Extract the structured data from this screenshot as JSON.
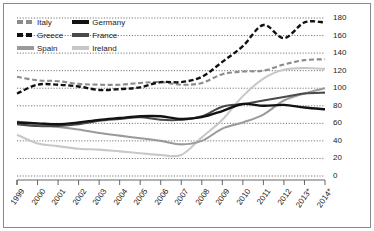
{
  "chart_data": {
    "type": "line",
    "title": "",
    "subtitle": "",
    "xlabel": "",
    "ylabel": "",
    "grid": true,
    "legend_position": "top-left",
    "x": [
      "1999",
      "2000",
      "2001",
      "2002",
      "2003",
      "2004",
      "2005",
      "2006",
      "2007",
      "2008",
      "2009",
      "2010",
      "2011",
      "2012",
      "2013*",
      "2014*"
    ],
    "xlim": [
      0,
      15
    ],
    "ylim": [
      0,
      180
    ],
    "yticks": [
      0,
      20,
      40,
      60,
      80,
      100,
      120,
      140,
      160,
      180
    ],
    "series": [
      {
        "name": "Italy",
        "style": "dashed",
        "color": "#8c8c8c",
        "values": [
          113,
          109,
          108,
          105,
          104,
          104,
          106,
          107,
          104,
          106,
          116,
          119,
          120,
          127,
          132,
          133
        ]
      },
      {
        "name": "Greece",
        "style": "dashed",
        "color": "#111111",
        "values": [
          94,
          104,
          104,
          102,
          98,
          99,
          101,
          107,
          107,
          113,
          130,
          148,
          172,
          157,
          175,
          175
        ]
      },
      {
        "name": "Spain",
        "style": "solid",
        "color": "#9a9a9a",
        "values": [
          62,
          59,
          56,
          53,
          49,
          46,
          43,
          40,
          36,
          40,
          54,
          61,
          70,
          86,
          94,
          100
        ]
      },
      {
        "name": "Germany",
        "style": "solid",
        "color": "#121212",
        "values": [
          61,
          60,
          59,
          61,
          64,
          66,
          68,
          68,
          65,
          67,
          74,
          82,
          80,
          81,
          78,
          76
        ]
      },
      {
        "name": "France",
        "style": "solid",
        "color": "#4a4a4a",
        "values": [
          59,
          57,
          57,
          59,
          63,
          65,
          67,
          64,
          64,
          68,
          79,
          82,
          86,
          90,
          94,
          95
        ]
      },
      {
        "name": "Ireland",
        "style": "solid",
        "color": "#c8c8c8",
        "values": [
          47,
          37,
          34,
          31,
          30,
          28,
          26,
          24,
          24,
          44,
          64,
          91,
          111,
          121,
          123,
          122
        ]
      }
    ]
  },
  "legend": {
    "columns": [
      {
        "items": [
          {
            "label": "Italy",
            "key": "italy"
          },
          {
            "label": "Greece",
            "key": "greece"
          },
          {
            "label": "Spain",
            "key": "spain"
          }
        ]
      },
      {
        "items": [
          {
            "label": "Germany",
            "key": "germany"
          },
          {
            "label": "France",
            "key": "france"
          },
          {
            "label": "Ireland",
            "key": "ireland"
          }
        ]
      }
    ]
  },
  "axis": {
    "y_labels": [
      "180",
      "160",
      "140",
      "120",
      "100",
      "80",
      "60",
      "40",
      "20",
      "0"
    ],
    "x_labels": [
      "1999",
      "2000",
      "2001",
      "2002",
      "2003",
      "2004",
      "2005",
      "2006",
      "2007",
      "2008",
      "2009",
      "2010",
      "2011",
      "2012",
      "2013*",
      "2014*"
    ]
  },
  "colors": {
    "frame": "#8a8a8a",
    "gridline": "#555555",
    "axis": "#555555",
    "text": "#1a1a1a",
    "background": "#ffffff"
  }
}
